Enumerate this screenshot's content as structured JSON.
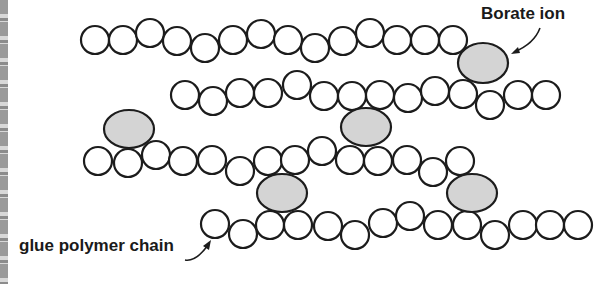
{
  "labels": {
    "borate": "Borate ion",
    "chain": "glue polymer chain"
  },
  "colors": {
    "monomer_fill": "#ffffff",
    "stroke": "#1c1c1c",
    "borate_fill": "#d4d4d4"
  },
  "monomer_radius": 14,
  "chains": [
    {
      "name": "polymer-chain-1",
      "monomers": [
        [
          95,
          40
        ],
        [
          123,
          40
        ],
        [
          150,
          33
        ],
        [
          177,
          41
        ],
        [
          205,
          48
        ],
        [
          233,
          40
        ],
        [
          261,
          34
        ],
        [
          288,
          40
        ],
        [
          315,
          48
        ],
        [
          343,
          41
        ],
        [
          370,
          33
        ],
        [
          397,
          40
        ],
        [
          425,
          40
        ],
        [
          453,
          40
        ]
      ]
    },
    {
      "name": "polymer-chain-2",
      "monomers": [
        [
          185,
          95
        ],
        [
          213,
          101
        ],
        [
          240,
          93
        ],
        [
          268,
          93
        ],
        [
          297,
          85
        ],
        [
          324,
          96
        ],
        [
          352,
          96
        ],
        [
          380,
          95
        ],
        [
          408,
          98
        ],
        [
          435,
          91
        ],
        [
          463,
          94
        ],
        [
          490,
          105
        ],
        [
          518,
          95
        ],
        [
          546,
          95
        ]
      ]
    },
    {
      "name": "polymer-chain-3",
      "monomers": [
        [
          98,
          161
        ],
        [
          128,
          163
        ],
        [
          156,
          155
        ],
        [
          183,
          161
        ],
        [
          212,
          160
        ],
        [
          240,
          171
        ],
        [
          268,
          161
        ],
        [
          295,
          160
        ],
        [
          322,
          151
        ],
        [
          350,
          160
        ],
        [
          378,
          161
        ],
        [
          407,
          160
        ],
        [
          433,
          172
        ],
        [
          460,
          161
        ]
      ]
    },
    {
      "name": "polymer-chain-4",
      "monomers": [
        [
          215,
          224
        ],
        [
          243,
          234
        ],
        [
          270,
          225
        ],
        [
          298,
          225
        ],
        [
          328,
          226
        ],
        [
          355,
          235
        ],
        [
          383,
          223
        ],
        [
          410,
          216
        ],
        [
          438,
          225
        ],
        [
          467,
          225
        ],
        [
          495,
          235
        ],
        [
          523,
          225
        ],
        [
          550,
          225
        ],
        [
          578,
          225
        ]
      ]
    }
  ],
  "borate_ions": [
    {
      "cx": 483,
      "cy": 63,
      "rx": 25,
      "ry": 20
    },
    {
      "cx": 129,
      "cy": 129,
      "rx": 25,
      "ry": 19
    },
    {
      "cx": 366,
      "cy": 127,
      "rx": 25,
      "ry": 19
    },
    {
      "cx": 282,
      "cy": 193,
      "rx": 25,
      "ry": 19
    },
    {
      "cx": 472,
      "cy": 193,
      "rx": 25,
      "ry": 19
    }
  ]
}
